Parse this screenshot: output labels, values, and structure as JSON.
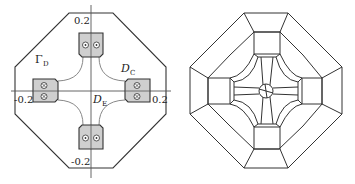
{
  "left_diagram": {
    "labels": {
      "gamma_d": "Γ",
      "gamma_d_sub": "D",
      "d_c": "D",
      "d_c_sub": "C",
      "d_e": "D",
      "d_e_sub": "E",
      "tick_top": "0.2",
      "tick_bottom": "-0.2",
      "tick_left": "-0.2",
      "tick_right": "0.2"
    },
    "boxes": [
      {
        "position": "top",
        "symbols": [
          "dot",
          "dot"
        ]
      },
      {
        "position": "left",
        "symbols": [
          "cross",
          "cross"
        ]
      },
      {
        "position": "right",
        "symbols": [
          "cross",
          "cross"
        ]
      },
      {
        "position": "bottom",
        "symbols": [
          "dot",
          "dot"
        ]
      }
    ],
    "colors": {
      "box_fill": "#cfcfcf",
      "stroke": "#333333",
      "curve": "#888888"
    }
  },
  "right_diagram": {
    "description": "octagonal mesh partition",
    "colors": {
      "stroke": "#333333"
    }
  }
}
